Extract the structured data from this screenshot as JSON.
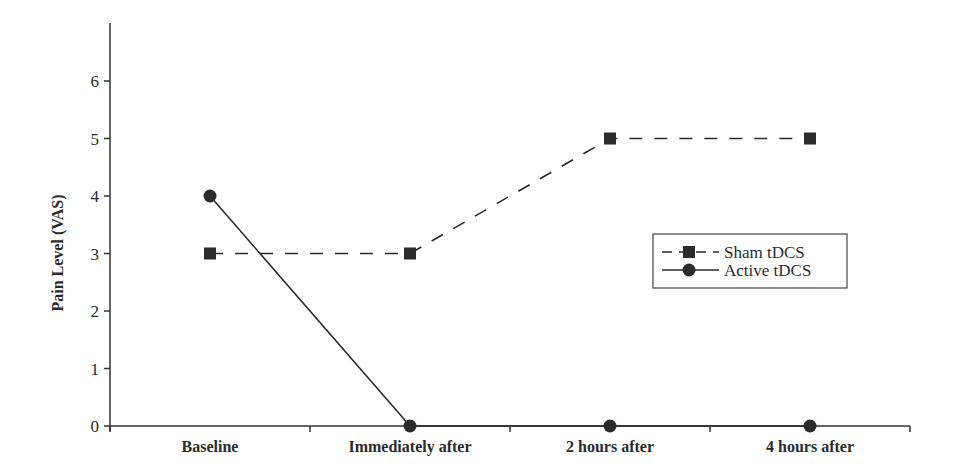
{
  "chart_data": {
    "type": "line",
    "title": "",
    "xlabel": "",
    "ylabel": "Pain Level (VAS)",
    "ylim": [
      0,
      7
    ],
    "yticks": [
      0,
      1,
      2,
      3,
      4,
      5,
      6
    ],
    "grid": false,
    "categories": [
      "Baseline",
      "Immediately after",
      "2 hours after",
      "4 hours after"
    ],
    "series": [
      {
        "name": "Sham tDCS",
        "marker": "square",
        "line_style": "dashed",
        "color": "#2b2b2b",
        "values": [
          3,
          3,
          5,
          5
        ]
      },
      {
        "name": "Active tDCS",
        "marker": "circle",
        "line_style": "solid",
        "color": "#2b2b2b",
        "values": [
          4,
          0,
          0,
          0
        ]
      }
    ],
    "legend_position": "center-right"
  }
}
